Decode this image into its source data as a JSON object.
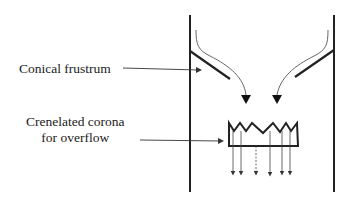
{
  "diagram": {
    "labels": {
      "conical_frustrum": "Conical frustrum",
      "corona_line1": "Crenelated corona",
      "corona_line2": "for overflow"
    },
    "colors": {
      "line": "#222222",
      "flow": "#555555",
      "background": "#ffffff"
    },
    "components": [
      "left-wall",
      "right-wall",
      "left-conical-plate",
      "right-conical-plate",
      "left-flow-arrow",
      "right-flow-arrow",
      "crenelated-corona",
      "overflow-arrows"
    ],
    "overflow_arrow_count": 6
  }
}
